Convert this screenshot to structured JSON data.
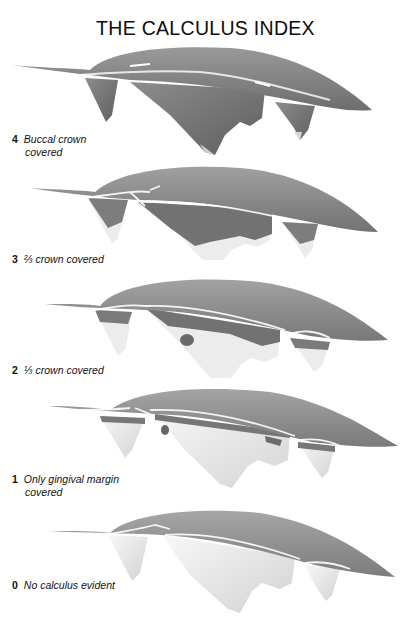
{
  "title": "THE CALCULUS INDEX",
  "panels": [
    {
      "score": "4",
      "label_line1": "Buccal crown",
      "label_line2": "covered",
      "coverage": "full"
    },
    {
      "score": "3",
      "label_line1": "⅔ crown covered",
      "label_line2": "",
      "coverage": "two-thirds"
    },
    {
      "score": "2",
      "label_line1": "⅓ crown covered",
      "label_line2": "",
      "coverage": "one-third"
    },
    {
      "score": "1",
      "label_line1": "Only gingival margin",
      "label_line2": "covered",
      "coverage": "margin"
    },
    {
      "score": "0",
      "label_line1": "No calculus evident",
      "label_line2": "",
      "coverage": "none"
    }
  ],
  "colors": {
    "gum": "#8a8a8a",
    "gum_dark": "#6e6e6e",
    "calculus": "#7a7a7a",
    "enamel": "#efefef",
    "highlight": "#ffffff"
  }
}
